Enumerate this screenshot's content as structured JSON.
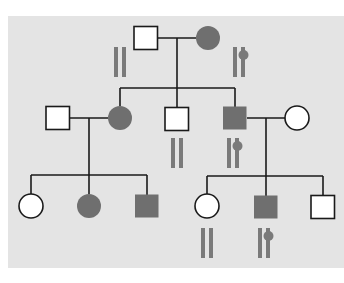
{
  "diagram": {
    "type": "pedigree",
    "colors": {
      "page_background": "#ffffff",
      "panel_background": "#e4e4e4",
      "affected_fill": "#6f6f6f",
      "unaffected_fill": "#ffffff",
      "line": "#1a1a1a",
      "chromosome": "#7a7a7a"
    },
    "panel": {
      "x": 8,
      "y": 16,
      "w": 336,
      "h": 252
    },
    "generations": [
      {
        "id": "I",
        "individuals": [
          {
            "id": "I-1",
            "sex": "male",
            "affected": false,
            "cx": 146,
            "cy": 38
          },
          {
            "id": "I-2",
            "sex": "female",
            "affected": true,
            "cx": 208,
            "cy": 38
          }
        ]
      },
      {
        "id": "II",
        "individuals": [
          {
            "id": "II-1",
            "sex": "male",
            "affected": false,
            "cx": 58,
            "cy": 118
          },
          {
            "id": "II-2",
            "sex": "female",
            "affected": true,
            "cx": 120,
            "cy": 118
          },
          {
            "id": "II-3",
            "sex": "male",
            "affected": false,
            "cx": 177,
            "cy": 119
          },
          {
            "id": "II-4",
            "sex": "male",
            "affected": true,
            "cx": 235,
            "cy": 118
          },
          {
            "id": "II-5",
            "sex": "female",
            "affected": false,
            "cx": 297,
            "cy": 118
          }
        ]
      },
      {
        "id": "III",
        "individuals": [
          {
            "id": "III-1",
            "sex": "female",
            "affected": false,
            "cx": 31,
            "cy": 206
          },
          {
            "id": "III-2",
            "sex": "female",
            "affected": true,
            "cx": 89,
            "cy": 206
          },
          {
            "id": "III-3",
            "sex": "male",
            "affected": true,
            "cx": 147,
            "cy": 206
          },
          {
            "id": "III-4",
            "sex": "female",
            "affected": false,
            "cx": 207,
            "cy": 206
          },
          {
            "id": "III-5",
            "sex": "male",
            "affected": true,
            "cx": 266,
            "cy": 207
          },
          {
            "id": "III-6",
            "sex": "male",
            "affected": false,
            "cx": 323,
            "cy": 207
          }
        ]
      }
    ],
    "chromosome_labels": [
      {
        "id": "chr-I-1",
        "for": "I-1",
        "marked": false,
        "x": 114,
        "y": 47
      },
      {
        "id": "chr-I-2",
        "for": "I-2",
        "marked": true,
        "x": 233,
        "y": 47
      },
      {
        "id": "chr-II-3",
        "for": "II-3",
        "marked": false,
        "x": 171,
        "y": 138
      },
      {
        "id": "chr-II-4",
        "for": "II-4",
        "marked": true,
        "x": 227,
        "y": 138
      },
      {
        "id": "chr-III-4",
        "for": "III-4",
        "marked": false,
        "x": 201,
        "y": 228
      },
      {
        "id": "chr-III-5",
        "for": "III-5",
        "marked": true,
        "x": 258,
        "y": 228
      }
    ]
  }
}
